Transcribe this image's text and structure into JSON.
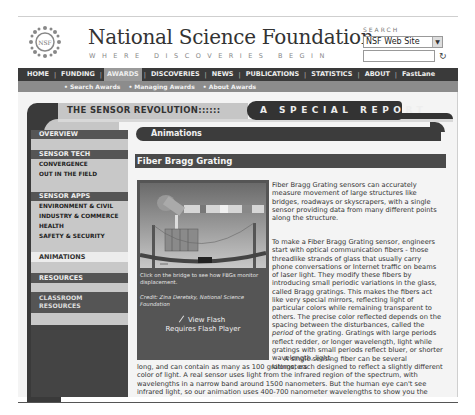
{
  "header": {
    "org_name": "National Science Foundation",
    "tagline": "WHERE DISCOVERIES BEGIN",
    "logo_text": "NSF"
  },
  "search": {
    "label": "SEARCH",
    "scope_selected": "NSF Web Site",
    "input_value": "",
    "go_icon": "refresh-arrow-icon"
  },
  "main_nav": {
    "items": [
      {
        "label": "HOME"
      },
      {
        "label": "FUNDING"
      },
      {
        "label": "AWARDS",
        "active": true
      },
      {
        "label": "DISCOVERIES"
      },
      {
        "label": "NEWS"
      },
      {
        "label": "PUBLICATIONS"
      },
      {
        "label": "STATISTICS"
      },
      {
        "label": "ABOUT"
      },
      {
        "label": "FastLane"
      }
    ]
  },
  "sub_nav": {
    "items": [
      {
        "label": "• Search Awards"
      },
      {
        "label": "• Managing Awards"
      },
      {
        "label": "• About Awards"
      }
    ]
  },
  "banner": {
    "title": "THE SENSOR REVOLUTION::::::",
    "report": "A SPECIAL REPORT"
  },
  "sidebar": {
    "overview": "OVERVIEW",
    "sensor_tech": {
      "heading": "SENSOR TECH",
      "items": [
        "CONVERGENCE",
        "OUT IN THE FIELD"
      ]
    },
    "sensor_apps": {
      "heading": "SENSOR APPS",
      "items": [
        "ENVIRONMENT & CIVIL",
        "INDUSTRY & COMMERCE",
        "HEALTH",
        "SAFETY & SECURITY"
      ]
    },
    "animations": "ANIMATIONS",
    "resources": "RESOURCES",
    "classroom_resources_line1": "CLASSROOM",
    "classroom_resources_line2": "RESOURCES"
  },
  "content": {
    "section_title": "Animations",
    "topic_title": "Fiber Bragg Grating",
    "figure": {
      "caption": "Click on the bridge to see how FBGs monitor displacement.",
      "credit": "Credit: Zina Deretsky, National Science Foundation",
      "view_flash": "View Flash",
      "requires_flash": "Requires Flash Player"
    },
    "para1": "Fiber Bragg Grating sensors can accurately measure movement of large structures like bridges, roadways or skyscrapers, with a single sensor providing data from many different points along the structure.",
    "para2_before": "To make a Fiber Bragg Grating sensor, engineers start with optical communication fibers - those threadlike strands of glass that usually carry phone conversations or Internet traffic on beams of laser light. They modify these fibers by introducing small periodic variations in the glass, called Bragg gratings. This makes the fibers act like very special mirrors, reflecting light of particular colors while remaining transparent to others. The precise color reflected depends on the spacing between the disturbances, called the ",
    "para2_em": "period",
    "para2_after": " of the grating. Gratings with large periods reflect redder, or longer wavelength, light while gratings with small periods reflect bluer, or shorter wavelength, light.",
    "para3a": "A single sensing fiber can be several kilometers",
    "para3b": "long, and can contain as many as 100 gratings, each designed to reflect a slightly different color of light. A real sensor uses light from the infrared region of the spectrum, with wavelengths in a narrow band around 1500 nanometers. But the human eye can't see infrared light, so our animation uses 400-700 nanometer wavelengths to show you the"
  }
}
